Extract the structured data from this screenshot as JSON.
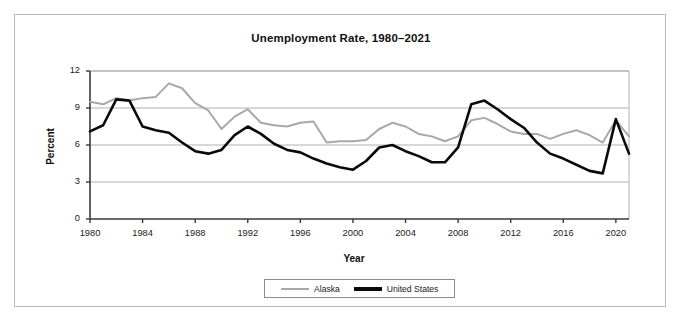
{
  "figure": {
    "title": "Unemployment Rate, 1980–2021",
    "border_color": "#b9b9b9",
    "background": "#ffffff"
  },
  "axes": {
    "y_title": "Percent",
    "x_title": "Year",
    "y_ticks": [
      "0",
      "3",
      "6",
      "9",
      "12"
    ],
    "x_ticks": [
      "1980",
      "1984",
      "1988",
      "1992",
      "1996",
      "2000",
      "2004",
      "2008",
      "2012",
      "2016",
      "2020"
    ]
  },
  "legend": {
    "position": "bottom-center",
    "entries": [
      {
        "label": "Alaska",
        "color": "#a8a8a8"
      },
      {
        "label": "United States",
        "color": "#0a0a0a"
      }
    ]
  },
  "chart_data": {
    "type": "line",
    "title": "Unemployment Rate, 1980–2021",
    "xlabel": "Year",
    "ylabel": "Percent",
    "xlim": [
      1980,
      2021
    ],
    "ylim": [
      0,
      12
    ],
    "yticks": [
      0,
      3,
      6,
      9,
      12
    ],
    "xticks": [
      1980,
      1984,
      1988,
      1992,
      1996,
      2000,
      2004,
      2008,
      2012,
      2016,
      2020
    ],
    "grid": "horizontal",
    "legend_position": "bottom-center",
    "x": [
      1980,
      1981,
      1982,
      1983,
      1984,
      1985,
      1986,
      1987,
      1988,
      1989,
      1990,
      1991,
      1992,
      1993,
      1994,
      1995,
      1996,
      1997,
      1998,
      1999,
      2000,
      2001,
      2002,
      2003,
      2004,
      2005,
      2006,
      2007,
      2008,
      2009,
      2010,
      2011,
      2012,
      2013,
      2014,
      2015,
      2016,
      2017,
      2018,
      2019,
      2020,
      2021
    ],
    "series": [
      {
        "name": "Alaska",
        "color": "#a8a8a8",
        "linewidth": 2,
        "values": [
          9.5,
          9.3,
          9.8,
          9.6,
          9.8,
          9.9,
          11.0,
          10.6,
          9.4,
          8.8,
          7.3,
          8.3,
          8.9,
          7.8,
          7.6,
          7.5,
          7.8,
          7.9,
          6.2,
          6.3,
          6.3,
          6.4,
          7.3,
          7.8,
          7.5,
          6.9,
          6.7,
          6.3,
          6.7,
          8.0,
          8.2,
          7.7,
          7.1,
          6.9,
          6.9,
          6.5,
          6.9,
          7.2,
          6.8,
          6.2,
          8.0,
          6.7
        ]
      },
      {
        "name": "United States",
        "color": "#0a0a0a",
        "linewidth": 2.6,
        "values": [
          7.1,
          7.6,
          9.7,
          9.6,
          7.5,
          7.2,
          7.0,
          6.2,
          5.5,
          5.3,
          5.6,
          6.8,
          7.5,
          6.9,
          6.1,
          5.6,
          5.4,
          4.9,
          4.5,
          4.2,
          4.0,
          4.7,
          5.8,
          6.0,
          5.5,
          5.1,
          4.6,
          4.6,
          5.8,
          9.3,
          9.6,
          8.9,
          8.1,
          7.4,
          6.2,
          5.3,
          4.9,
          4.4,
          3.9,
          3.7,
          8.1,
          5.3
        ]
      }
    ]
  }
}
